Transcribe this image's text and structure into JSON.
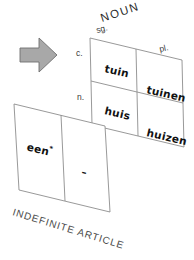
{
  "diagram": {
    "title": "NOUN",
    "caption": "INDEFINITE ARTICLE",
    "column_headers": {
      "singular": "sg.",
      "plural": "pl."
    },
    "row_headers": {
      "common": "c.",
      "neuter": "n."
    },
    "noun_table": {
      "rows": [
        {
          "gender": "c.",
          "singular": "tuin",
          "plural": "tuinen"
        },
        {
          "gender": "n.",
          "singular": "huis",
          "plural": "huizen"
        }
      ]
    },
    "article_panel": {
      "singular_form": "een",
      "singular_marker": "*",
      "plural_form": "–"
    },
    "arrow": {
      "icon": "right-arrow-icon",
      "direction": "right"
    },
    "colors": {
      "stroke": "#8d8d8d",
      "arrow_fill": "#a8a8a8",
      "arrow_stroke": "#6f6f6f",
      "text": "#111111",
      "background": "#ffffff"
    }
  }
}
